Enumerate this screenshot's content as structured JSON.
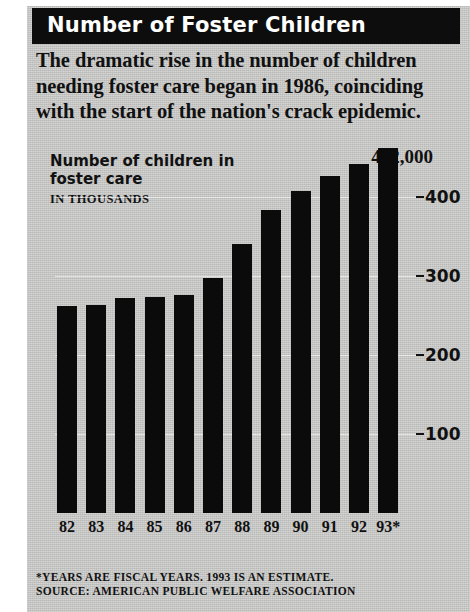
{
  "header": {
    "title": "Number of Foster Children",
    "deck": "The dramatic rise in the number of children needing foster care began in 1986, coinciding with the start of the nation's crack epidemic."
  },
  "footnote": {
    "line1": "*YEARS ARE FISCAL YEARS. 1993 IS AN ESTIMATE.",
    "line2": "SOURCE: AMERICAN PUBLIC WELFARE ASSOCIATION"
  },
  "colors": {
    "panel": "#c9c9c7",
    "bar": "#0b0b0b",
    "titlebar": "#0d0d0d",
    "text": "#111111"
  },
  "chart_data": {
    "type": "bar",
    "title": "Number of children in foster care",
    "subtitle": "IN THOUSANDS",
    "xlabel": "",
    "ylabel": "IN THOUSANDS",
    "categories": [
      "82",
      "83",
      "84",
      "85",
      "86",
      "87",
      "88",
      "89",
      "90",
      "91",
      "92",
      "93*"
    ],
    "values": [
      262,
      263,
      272,
      273,
      276,
      297,
      340,
      383,
      407,
      426,
      442,
      462
    ],
    "ylim": [
      0,
      470
    ],
    "yticks": [
      100,
      200,
      300,
      400
    ],
    "ytick_labels": [
      "100",
      "200",
      "300",
      "400"
    ],
    "grid": true,
    "legend": false,
    "annotations": [
      {
        "label": "462,000",
        "category": "93*",
        "value": 462
      }
    ]
  }
}
